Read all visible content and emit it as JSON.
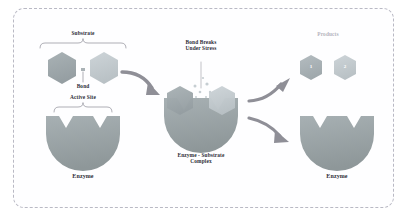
{
  "diagram": {
    "title_visible": false,
    "border_style": "dashed-rounded",
    "colors": {
      "substrate_left": "#9ea8ab",
      "substrate_right": "#c2cace",
      "enzyme_body": "#9aa3a7",
      "enzyme_body_light": "#b6bec1",
      "arrow": "#8f8f97",
      "frame_border": "#b9b9c4",
      "label_text": "#2f2f38",
      "label_faint": "#b4b4bd",
      "background": "#ffffff",
      "particle": "#cdd4d7"
    },
    "stages": [
      {
        "id": "substrate-stage",
        "labels": {
          "substrate": "Substrate",
          "bond": "Bond",
          "active_site": "Active Site",
          "enzyme": "Enzyme"
        }
      },
      {
        "id": "complex-stage",
        "labels": {
          "bond_breaks": "Bond Breaks\nUnder Stress",
          "complex": "Enzyme - Substrate\nComplex"
        }
      },
      {
        "id": "products-stage",
        "labels": {
          "products": "Products",
          "enzyme": "Enzyme"
        },
        "product_markers": [
          "1",
          "2"
        ]
      }
    ],
    "arrows": [
      {
        "id": "arrow-substrate-to-complex",
        "direction": "down-right"
      },
      {
        "id": "arrow-complex-to-products",
        "direction": "up-right"
      },
      {
        "id": "arrow-complex-to-enzyme",
        "direction": "down-right"
      }
    ]
  }
}
